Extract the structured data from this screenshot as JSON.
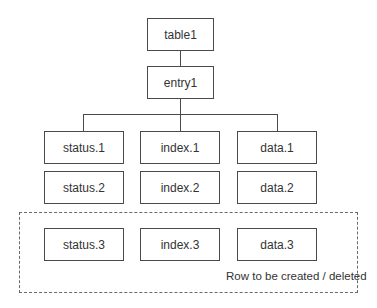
{
  "diagram": {
    "type": "tree",
    "root": {
      "label": "table1"
    },
    "entry": {
      "label": "entry1"
    },
    "columns": [
      {
        "name": "status",
        "cells": [
          "status.1",
          "status.2",
          "status.3"
        ]
      },
      {
        "name": "index",
        "cells": [
          "index.1",
          "index.2",
          "index.3"
        ]
      },
      {
        "name": "data",
        "cells": [
          "data.1",
          "data.2",
          "data.3"
        ]
      }
    ],
    "highlight_group": {
      "style": "dashed",
      "caption": "Row to be created / deleted",
      "row": 3
    },
    "colors": {
      "stroke": "#4a4a4a",
      "text": "#333333",
      "background": "#ffffff"
    }
  }
}
